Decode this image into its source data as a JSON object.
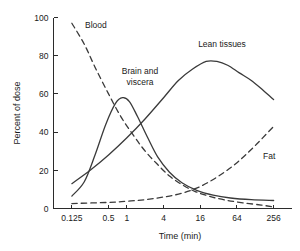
{
  "chart_data": {
    "type": "line",
    "title": "",
    "xlabel": "Time (min)",
    "ylabel": "Percent of dose",
    "x_scale": "log2",
    "xlim": [
      0.0625,
      512
    ],
    "ylim": [
      0,
      100
    ],
    "grid": false,
    "legend": "inline-annotations",
    "xticks": [
      "0.125",
      "0.5",
      "1",
      "4",
      "16",
      "64",
      "256"
    ],
    "xtick_values": [
      0.125,
      0.5,
      1,
      4,
      16,
      64,
      256
    ],
    "yticks": [
      "0",
      "20",
      "40",
      "60",
      "80",
      "100"
    ],
    "ytick_values": [
      0,
      20,
      40,
      60,
      80,
      100
    ],
    "series": [
      {
        "name": "Blood",
        "style": "dashed",
        "label": "Blood",
        "x": [
          0.125,
          0.2,
          0.3,
          0.5,
          0.8,
          1.3,
          2,
          3.2,
          5,
          8,
          13,
          22,
          40,
          80,
          160,
          256
        ],
        "values": [
          97,
          86,
          74,
          60,
          48,
          38,
          30,
          23,
          17,
          12.5,
          9,
          6.5,
          4.5,
          3,
          1.8,
          0.8
        ]
      },
      {
        "name": "Brain and viscera",
        "style": "solid",
        "label": "Brain and viscera",
        "x": [
          0.125,
          0.2,
          0.3,
          0.45,
          0.65,
          0.85,
          1.1,
          1.5,
          2.2,
          3.2,
          5,
          8,
          14,
          26,
          50,
          110,
          256
        ],
        "values": [
          6.5,
          14,
          28,
          44,
          55,
          58,
          56,
          48,
          37,
          27,
          19,
          13.5,
          9.5,
          7,
          5.5,
          4.6,
          4.2
        ]
      },
      {
        "name": "Lean tissues",
        "style": "solid",
        "label": "Lean tissues",
        "x": [
          0.125,
          0.25,
          0.5,
          1,
          2,
          4,
          7,
          12,
          20,
          30,
          45,
          70,
          110,
          170,
          256
        ],
        "values": [
          13,
          20,
          28,
          37,
          47,
          58,
          67,
          73,
          77,
          77,
          75,
          71,
          67,
          62,
          57
        ]
      },
      {
        "name": "Fat",
        "style": "dashed",
        "label": "Fat",
        "x": [
          0.125,
          0.5,
          1,
          2,
          4,
          8,
          16,
          32,
          64,
          128,
          256
        ],
        "values": [
          2.6,
          3.2,
          3.8,
          4.6,
          6,
          8,
          11.5,
          17,
          24,
          33,
          43
        ]
      }
    ],
    "annotations": [
      {
        "text": "Blood",
        "series": "Blood"
      },
      {
        "text_line1": "Brain and",
        "text_line2": "viscera",
        "series": "Brain and viscera"
      },
      {
        "text": "Lean tissues",
        "series": "Lean tissues"
      },
      {
        "text": "Fat",
        "series": "Fat"
      }
    ]
  },
  "colors": {
    "background": "#ffffff",
    "axis": "#2b2b2b",
    "curve": "#3a3a3a",
    "text": "#1a1a1a"
  }
}
